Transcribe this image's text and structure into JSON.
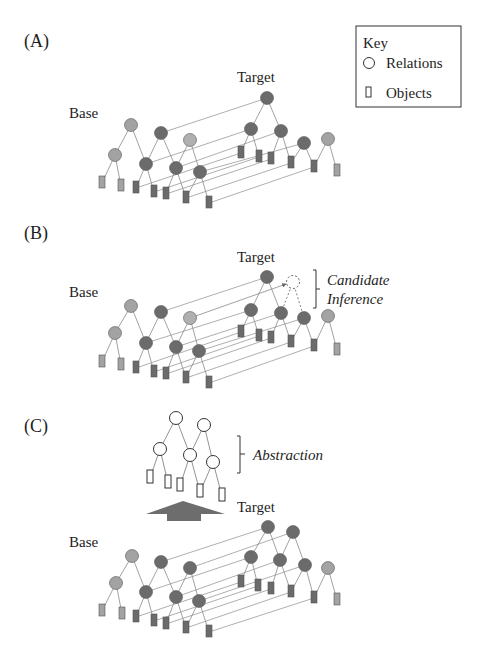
{
  "colors": {
    "background": "#ffffff",
    "dark_node": "#6b6b6b",
    "light_node": "#a3a3a3",
    "edge": "#8a8a8a",
    "mapping_line": "#9a9a9a",
    "stroke": "#555555",
    "text": "#1e1e1e",
    "arrow": "#6d6d6d"
  },
  "key": {
    "title": "Key",
    "items": [
      {
        "icon": "circle-icon",
        "label": "Relations"
      },
      {
        "icon": "rectangle-icon",
        "label": "Objects"
      }
    ]
  },
  "panels": [
    {
      "id": "A",
      "label": "(A)",
      "base_label": "Base",
      "target_label": "Target"
    },
    {
      "id": "B",
      "label": "(B)",
      "base_label": "Base",
      "target_label": "Target",
      "annotation": [
        "Candidate",
        "Inference"
      ]
    },
    {
      "id": "C",
      "label": "(C)",
      "base_label": "Base",
      "target_label": "Target",
      "annotation": [
        "Abstraction"
      ]
    }
  ]
}
